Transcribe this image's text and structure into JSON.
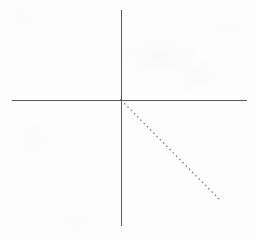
{
  "figure": {
    "title": "",
    "background_color": "#fdfdfd",
    "width": 256,
    "height": 240
  },
  "chart_data": {
    "type": "line",
    "title": "",
    "subtitle": "",
    "xlabel": "",
    "ylabel": "",
    "grid": false,
    "legend": null,
    "axis_style": {
      "color": "#595959",
      "stroke_width": 1,
      "arrowheads": false,
      "tick_marks": false,
      "tick_labels": false
    },
    "origin_px": {
      "x": 121,
      "y": 100
    },
    "axes": [
      {
        "name": "x-axis",
        "orientation": "horizontal",
        "start_px": {
          "x": 12,
          "y": 100
        },
        "end_px": {
          "x": 247,
          "y": 100
        },
        "color": "#595959"
      },
      {
        "name": "y-axis",
        "orientation": "vertical",
        "start_px": {
          "x": 121,
          "y": 10
        },
        "end_px": {
          "x": 121,
          "y": 226
        },
        "color": "#595959"
      }
    ],
    "series": [
      {
        "name": "dashed-ray",
        "style": "dashed",
        "dash_pattern": "1.6 3",
        "color": "#7a7a7f",
        "stroke_width": 1.2,
        "quadrant": "fourth",
        "slope": -1.01,
        "points_px": [
          {
            "x": 121,
            "y": 100
          },
          {
            "x": 221,
            "y": 201
          }
        ],
        "x": [
          0,
          100
        ],
        "values": [
          0,
          -101
        ]
      }
    ],
    "annotations": [],
    "tick_labels": {
      "x": [],
      "y": []
    },
    "xlim": [
      -109,
      126
    ],
    "ylim": [
      -126,
      90
    ]
  }
}
